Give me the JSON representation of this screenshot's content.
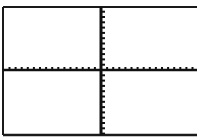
{
  "chart_data": {
    "type": "line",
    "title": "",
    "xlabel": "",
    "ylabel": "",
    "series": [],
    "xlim": [
      -16,
      16
    ],
    "ylim": [
      -12,
      12
    ],
    "xscl": 1,
    "yscl": 1,
    "grid": false,
    "axes_visible": true,
    "tick_marks": true,
    "tick_labels": false,
    "legend": null
  },
  "screen": {
    "frame_color": "#1a1a1a",
    "axis_color": "#111111",
    "background": "#ffffff",
    "plot_left": 3,
    "plot_right": 197,
    "plot_top": 7,
    "plot_bottom": 135,
    "origin_x": 101,
    "origin_y": 70,
    "x_tick_spacing": 6.1,
    "y_tick_spacing": 5.3
  }
}
